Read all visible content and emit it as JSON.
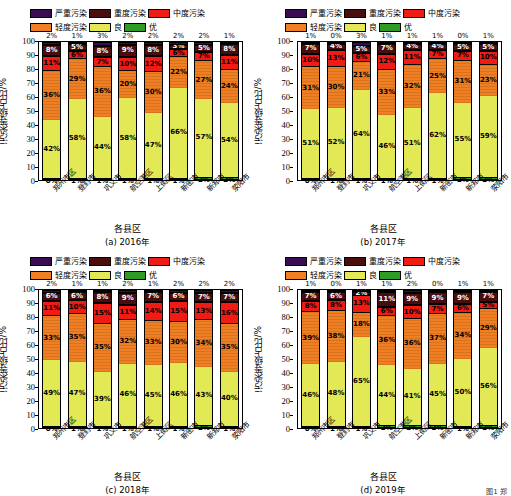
{
  "legend": {
    "items": [
      {
        "label": "严重污染",
        "color": "#3a0a52",
        "key": "yanzhong"
      },
      {
        "label": "重度污染",
        "color": "#4a0d0d",
        "key": "zhongdu"
      },
      {
        "label": "中度污染",
        "color": "#f01b14",
        "key": "zhongdu_mid"
      },
      {
        "label": "轻度污染",
        "color": "#ef7f22",
        "key": "qingdu"
      },
      {
        "label": "良",
        "color": "#e3e855",
        "key": "liang"
      },
      {
        "label": "优",
        "color": "#2e9b26",
        "key": "you"
      }
    ]
  },
  "axes": {
    "ylabel": "污染等级占比/%",
    "xlabel": "各县区",
    "yticks": [
      "0",
      "10",
      "20",
      "30",
      "40",
      "50",
      "60",
      "70",
      "80",
      "90",
      "100"
    ],
    "ylim": [
      0,
      100
    ]
  },
  "categories": [
    "郑州市区",
    "登封市",
    "巩义市",
    "航空港区",
    "上街区",
    "新密市",
    "新郑市",
    "荥阳市"
  ],
  "panels": [
    {
      "caption": "(a) 2016年",
      "year": "2016"
    },
    {
      "caption": "(b) 2017年",
      "year": "2017"
    },
    {
      "caption": "(c) 2018年",
      "year": "2018"
    },
    {
      "caption": "(d) 2019年",
      "year": "2019"
    }
  ],
  "chart_data": [
    {
      "type": "bar",
      "stacked": true,
      "title": "(a) 2016年",
      "xlabel": "各县区",
      "ylabel": "污染等级占比/%",
      "ylim": [
        0,
        100
      ],
      "grid": false,
      "legend_position": "top",
      "categories": [
        "郑州市区",
        "登封市",
        "巩义市",
        "航空港区",
        "上街区",
        "新密市",
        "新郑市",
        "荥阳市"
      ],
      "series": [
        {
          "name": "优",
          "color": "#2e9b26",
          "values": [
            0,
            1,
            1,
            1,
            1,
            1,
            2,
            2
          ]
        },
        {
          "name": "良",
          "color": "#e3e855",
          "values": [
            42,
            58,
            44,
            58,
            47,
            66,
            57,
            54
          ]
        },
        {
          "name": "轻度污染",
          "color": "#ef7f22",
          "values": [
            36,
            29,
            36,
            20,
            30,
            22,
            27,
            24
          ]
        },
        {
          "name": "中度污染",
          "color": "#f01b14",
          "values": [
            11,
            6,
            7,
            10,
            12,
            6,
            7,
            11
          ]
        },
        {
          "name": "重度污染",
          "color": "#4a0d0d",
          "values": [
            8,
            5,
            8,
            9,
            8,
            3,
            5,
            8
          ]
        },
        {
          "name": "严重污染",
          "color": "#3a0a52",
          "values": [
            2,
            1,
            3,
            2,
            2,
            2,
            2,
            1
          ]
        }
      ]
    },
    {
      "type": "bar",
      "stacked": true,
      "title": "(b) 2017年",
      "xlabel": "各县区",
      "ylabel": "污染等级占比/%",
      "ylim": [
        0,
        100
      ],
      "grid": false,
      "legend_position": "top",
      "categories": [
        "郑州市区",
        "登封市",
        "巩义市",
        "航空港区",
        "上街区",
        "新密市",
        "新郑市",
        "荥阳市"
      ],
      "series": [
        {
          "name": "优",
          "color": "#2e9b26",
          "values": [
            0,
            1,
            1,
            1,
            1,
            1,
            2,
            2
          ]
        },
        {
          "name": "良",
          "color": "#e3e855",
          "values": [
            51,
            52,
            64,
            46,
            51,
            62,
            55,
            59
          ]
        },
        {
          "name": "轻度污染",
          "color": "#ef7f22",
          "values": [
            31,
            30,
            21,
            33,
            32,
            25,
            31,
            23
          ]
        },
        {
          "name": "中度污染",
          "color": "#f01b14",
          "values": [
            10,
            13,
            6,
            12,
            11,
            7,
            7,
            10
          ]
        },
        {
          "name": "重度污染",
          "color": "#4a0d0d",
          "values": [
            7,
            4,
            5,
            7,
            4,
            4,
            5,
            5
          ]
        },
        {
          "name": "严重污染",
          "color": "#3a0a52",
          "values": [
            1,
            0,
            3,
            1,
            1,
            1,
            0,
            1
          ]
        }
      ]
    },
    {
      "type": "bar",
      "stacked": true,
      "title": "(c) 2018年",
      "xlabel": "各县区",
      "ylabel": "污染等级占比/%",
      "ylim": [
        0,
        100
      ],
      "grid": false,
      "legend_position": "top",
      "categories": [
        "郑州市区",
        "登封市",
        "巩义市",
        "航空港区",
        "上街区",
        "新密市",
        "新郑市",
        "荥阳市"
      ],
      "series": [
        {
          "name": "优",
          "color": "#2e9b26",
          "values": [
            0,
            1,
            1,
            1,
            1,
            1,
            2,
            1
          ]
        },
        {
          "name": "良",
          "color": "#e3e855",
          "values": [
            49,
            47,
            39,
            46,
            45,
            46,
            43,
            40
          ]
        },
        {
          "name": "轻度污染",
          "color": "#ef7f22",
          "values": [
            33,
            35,
            35,
            32,
            33,
            30,
            34,
            35
          ]
        },
        {
          "name": "中度污染",
          "color": "#f01b14",
          "values": [
            11,
            10,
            15,
            11,
            14,
            15,
            13,
            16
          ]
        },
        {
          "name": "重度污染",
          "color": "#4a0d0d",
          "values": [
            6,
            6,
            8,
            9,
            7,
            6,
            7,
            7
          ]
        },
        {
          "name": "严重污染",
          "color": "#3a0a52",
          "values": [
            2,
            1,
            1,
            2,
            1,
            2,
            2,
            2
          ]
        }
      ]
    },
    {
      "type": "bar",
      "stacked": true,
      "title": "(d) 2019年",
      "xlabel": "各县区",
      "ylabel": "污染等级占比/%",
      "ylim": [
        0,
        100
      ],
      "grid": false,
      "legend_position": "top",
      "categories": [
        "郑州市区",
        "登封市",
        "巩义市",
        "航空港区",
        "上街区",
        "新密市",
        "新郑市",
        "荥阳市"
      ],
      "series": [
        {
          "name": "优",
          "color": "#2e9b26",
          "values": [
            0,
            1,
            1,
            2,
            2,
            2,
            1,
            2
          ]
        },
        {
          "name": "良",
          "color": "#e3e855",
          "values": [
            46,
            48,
            65,
            44,
            41,
            45,
            50,
            56
          ]
        },
        {
          "name": "轻度污染",
          "color": "#ef7f22",
          "values": [
            39,
            38,
            18,
            36,
            36,
            37,
            34,
            29
          ]
        },
        {
          "name": "中度污染",
          "color": "#f01b14",
          "values": [
            8,
            8,
            13,
            6,
            10,
            7,
            6,
            5
          ]
        },
        {
          "name": "重度污染",
          "color": "#4a0d0d",
          "values": [
            7,
            6,
            2,
            11,
            9,
            9,
            9,
            7
          ]
        },
        {
          "name": "严重污染",
          "color": "#3a0a52",
          "values": [
            1,
            0,
            1,
            1,
            2,
            0,
            1,
            1
          ]
        }
      ]
    }
  ],
  "figure_caption": "图1 郑"
}
